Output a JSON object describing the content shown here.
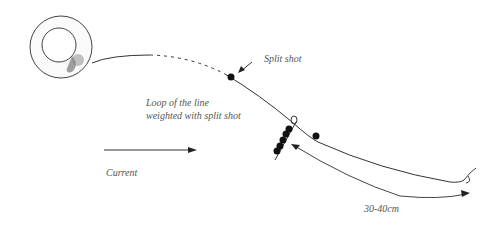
{
  "diagram": {
    "labels": {
      "split_shot": "Split shot",
      "loop_line1": "Loop of the line",
      "loop_line2": "weighted with split shot",
      "current": "Current",
      "length": "30-40cm"
    },
    "colors": {
      "line": "#333333",
      "text": "#555555",
      "shot": "#111111"
    }
  }
}
